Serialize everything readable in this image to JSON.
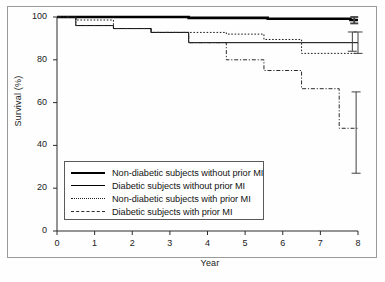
{
  "chart_data": {
    "type": "line",
    "subtype": "kaplan-meier-survival",
    "title": "",
    "xlabel": "Year",
    "ylabel": "Survival (%)",
    "xlim": [
      0,
      8
    ],
    "ylim": [
      0,
      100
    ],
    "xticks": [
      0,
      1,
      2,
      3,
      4,
      5,
      6,
      7,
      8
    ],
    "yticks": [
      0,
      20,
      40,
      60,
      80,
      100
    ],
    "xtick_labels": [
      "0",
      "1",
      "2",
      "3",
      "4",
      "5",
      "6",
      "7",
      "8"
    ],
    "ytick_labels": [
      "0",
      "20",
      "40",
      "60",
      "80",
      "100"
    ],
    "grid": false,
    "legend_position": "lower-left-inside",
    "series": [
      {
        "name": "Non-diabetic subjects without prior MI",
        "style": "solid-thick",
        "color": "#000000",
        "width": 2.6,
        "steps": [
          {
            "x": 0.0,
            "y": 100.0
          },
          {
            "x": 3.5,
            "y": 99.6
          },
          {
            "x": 5.6,
            "y": 99.2
          },
          {
            "x": 7.8,
            "y": 98.6
          }
        ],
        "errorbar": {
          "x": 7.9,
          "low": 97.0,
          "high": 100.0,
          "estimate": 98.6
        }
      },
      {
        "name": "Diabetic subjects without prior MI",
        "style": "solid-thin",
        "color": "#000000",
        "width": 1.0,
        "steps": [
          {
            "x": 0.0,
            "y": 100.0
          },
          {
            "x": 0.5,
            "y": 96.0
          },
          {
            "x": 1.5,
            "y": 94.6
          },
          {
            "x": 2.5,
            "y": 92.8
          },
          {
            "x": 3.5,
            "y": 88.0
          },
          {
            "x": 6.5,
            "y": 88.0
          }
        ],
        "errorbar": {
          "x": 7.85,
          "low": 84.0,
          "high": 93.0,
          "estimate": 88.0
        }
      },
      {
        "name": "Non-diabetic subjects with prior MI",
        "style": "dotted",
        "color": "#1c1c1c",
        "width": 1.0,
        "steps": [
          {
            "x": 0.0,
            "y": 100.0
          },
          {
            "x": 0.5,
            "y": 98.6
          },
          {
            "x": 1.5,
            "y": 94.6
          },
          {
            "x": 2.5,
            "y": 92.8
          },
          {
            "x": 4.5,
            "y": 92.0
          },
          {
            "x": 5.5,
            "y": 89.5
          },
          {
            "x": 6.5,
            "y": 83.0
          }
        ],
        "errorbar": {
          "x": 8.0,
          "low": 83.0,
          "high": 93.0,
          "estimate": 83.0
        }
      },
      {
        "name": "Diabetic subjects with prior MI",
        "style": "dash-dot",
        "color": "#2a2a2a",
        "width": 1.0,
        "steps": [
          {
            "x": 0.0,
            "y": 100.0
          },
          {
            "x": 0.5,
            "y": 96.0
          },
          {
            "x": 1.5,
            "y": 94.6
          },
          {
            "x": 2.5,
            "y": 92.8
          },
          {
            "x": 3.5,
            "y": 88.0
          },
          {
            "x": 4.5,
            "y": 80.0
          },
          {
            "x": 5.5,
            "y": 75.0
          },
          {
            "x": 6.5,
            "y": 66.5
          },
          {
            "x": 7.5,
            "y": 48.0
          }
        ],
        "errorbar": {
          "x": 7.95,
          "low": 27.0,
          "high": 65.0,
          "estimate": 48.0
        }
      }
    ],
    "legend_entries": [
      {
        "label": "Non-diabetic subjects without prior MI",
        "style": "solid-thick"
      },
      {
        "label": "Diabetic subjects without prior MI",
        "style": "solid-thin"
      },
      {
        "label": "Non-diabetic subjects with prior MI",
        "style": "dotted"
      },
      {
        "label": "Diabetic subjects with prior MI",
        "style": "dash-dot"
      }
    ]
  }
}
